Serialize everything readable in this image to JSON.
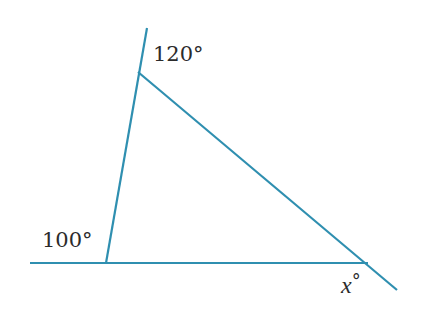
{
  "diagram": {
    "type": "triangle-exterior-angles",
    "line_color": "#2f8fb0",
    "labels": {
      "top_angle": "120°",
      "left_angle": "100°",
      "right_angle_var": "x",
      "right_angle_deg": "°"
    }
  }
}
